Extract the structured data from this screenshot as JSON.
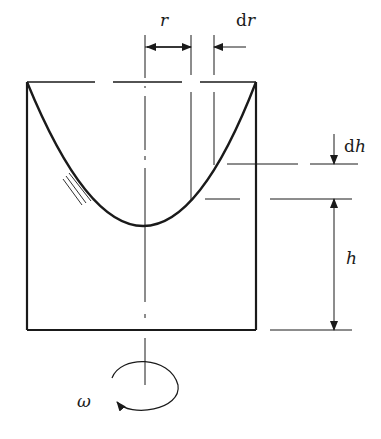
{
  "diagram": {
    "colors": {
      "stroke": "#1a1a1a",
      "background": "#ffffff"
    },
    "labels": {
      "r": "r",
      "dr_d": "d",
      "dr_r": "r",
      "dh_d": "d",
      "dh_h": "h",
      "h": "h",
      "omega": "ω"
    }
  }
}
